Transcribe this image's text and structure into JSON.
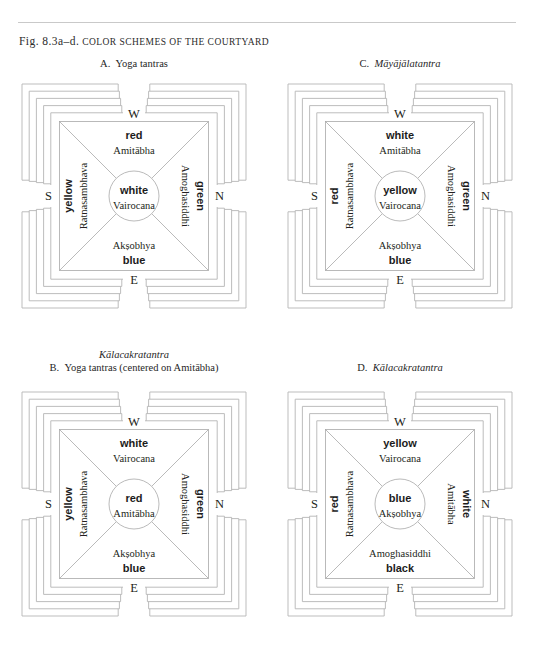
{
  "figure": {
    "label": "Fig. 8.3a–d.",
    "title": "Color schemes of the courtyard",
    "title_full": "Fig. 8.3a–d. Color schemes of the courtyard"
  },
  "panels": [
    {
      "id": "A",
      "caption_letter": "A.",
      "caption_title": "Yoga tantras",
      "caption_title_italic": false,
      "caption_extra": "",
      "center": {
        "color": "white",
        "deity": "Vairocana",
        "color_first": true
      },
      "west": {
        "color": "red",
        "deity": "Amitābha",
        "color_first": true
      },
      "east": {
        "color": "blue",
        "deity": "Akṣobhya",
        "color_first": false
      },
      "south": {
        "color": "yellow",
        "deity": "Ratnasambhava",
        "color_outer": true
      },
      "north": {
        "color": "green",
        "deity": "Amoghasiddhi",
        "color_outer": true
      },
      "directions": {
        "w": "W",
        "e": "E",
        "s": "S",
        "n": "N"
      }
    },
    {
      "id": "C",
      "caption_letter": "C.",
      "caption_title": "Māyājālatantra",
      "caption_title_italic": true,
      "caption_extra": "",
      "center": {
        "color": "yellow",
        "deity": "Vairocana",
        "color_first": true
      },
      "west": {
        "color": "white",
        "deity": "Amitābha",
        "color_first": true
      },
      "east": {
        "color": "blue",
        "deity": "Akṣobhya",
        "color_first": false
      },
      "south": {
        "color": "red",
        "deity": "Ratnasambhava",
        "color_outer": true
      },
      "north": {
        "color": "green",
        "deity": "Amoghasiddhi",
        "color_outer": true
      },
      "directions": {
        "w": "W",
        "e": "E",
        "s": "S",
        "n": "N"
      }
    },
    {
      "id": "B",
      "caption_letter": "B.",
      "caption_title": "Yoga tantras (centered on Amitābha)",
      "caption_title_italic": false,
      "caption_extra": "Kālacakratantra",
      "center": {
        "color": "red",
        "deity": "Amitābha",
        "color_first": true
      },
      "west": {
        "color": "white",
        "deity": "Vairocana",
        "color_first": true
      },
      "east": {
        "color": "blue",
        "deity": "Akṣobhya",
        "color_first": false
      },
      "south": {
        "color": "yellow",
        "deity": "Ratnasambhava",
        "color_outer": true
      },
      "north": {
        "color": "green",
        "deity": "Amoghasiddhi",
        "color_outer": true
      },
      "directions": {
        "w": "W",
        "e": "E",
        "s": "S",
        "n": "N"
      }
    },
    {
      "id": "D",
      "caption_letter": "D.",
      "caption_title": "Kālacakratantra",
      "caption_title_italic": true,
      "caption_extra": "",
      "center": {
        "color": "blue",
        "deity": "Akṣobhya",
        "color_first": true
      },
      "west": {
        "color": "yellow",
        "deity": "Vairocana",
        "color_first": true
      },
      "east": {
        "color": "black",
        "deity": "Amoghasiddhi",
        "color_first": false
      },
      "south": {
        "color": "red",
        "deity": "Ratnasambhava",
        "color_outer": true
      },
      "north": {
        "color": "white",
        "deity": "Amitābha",
        "color_outer": true
      },
      "directions": {
        "w": "W",
        "e": "E",
        "s": "S",
        "n": "N"
      }
    }
  ],
  "style": {
    "line_color": "#b6b6b6",
    "text_color": "#231f20",
    "rule_color": "#c9c9c9",
    "background": "#ffffff"
  }
}
